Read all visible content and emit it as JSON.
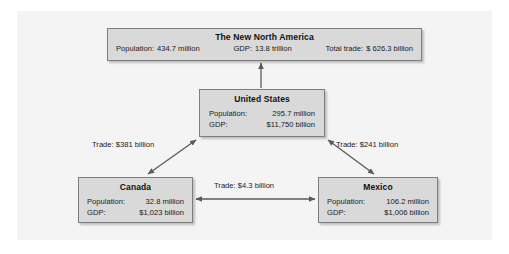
{
  "diagram": {
    "title": "The New North America",
    "nodes": {
      "north_america": {
        "name": "The New North America",
        "stats": [
          {
            "label": "Population:",
            "value": "434.7 million"
          },
          {
            "label": "GDP:",
            "value": "13.8 trillion"
          },
          {
            "label": "Total trade:",
            "value": "$ 626.3 billion"
          }
        ]
      },
      "united_states": {
        "name": "United States",
        "rows": [
          {
            "label": "Population:",
            "value": "295.7 million"
          },
          {
            "label": "GDP:",
            "value": "$11,750 billion"
          }
        ]
      },
      "canada": {
        "name": "Canada",
        "rows": [
          {
            "label": "Population:",
            "value": "32.8 million"
          },
          {
            "label": "GDP:",
            "value": "$1,023 billion"
          }
        ]
      },
      "mexico": {
        "name": "Mexico",
        "rows": [
          {
            "label": "Population:",
            "value": "106.2 million"
          },
          {
            "label": "GDP:",
            "value": "$1,006 billion"
          }
        ]
      }
    },
    "edges": {
      "canada_us": {
        "label": "Trade: $381 billion",
        "arrow": "double"
      },
      "us_mexico": {
        "label": "Trade: $241 billion",
        "arrow": "double"
      },
      "canada_mexico": {
        "label": "Trade: $4.3 billion",
        "arrow": "double"
      },
      "us_north_america": {
        "label": "",
        "arrow": "single-up"
      }
    },
    "colors": {
      "page_background": "#ffffff",
      "panel_background": "#f4f4f4",
      "box_fill": "#d9d9d9",
      "box_border": "#7d7d7d",
      "connector": "#5a5a5a",
      "text": "#1a1a1a"
    }
  }
}
